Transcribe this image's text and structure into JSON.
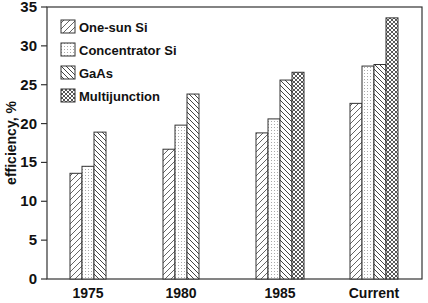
{
  "chart_data": {
    "type": "bar",
    "title": "",
    "xlabel": "",
    "ylabel": "efficiency, %",
    "ylim": [
      0,
      35
    ],
    "yticks": [
      0,
      5,
      10,
      15,
      20,
      25,
      30,
      35
    ],
    "grid": false,
    "legend_position": "upper-left",
    "categories": [
      "1975",
      "1980",
      "1985",
      "Current"
    ],
    "series": [
      {
        "name": "One-sun Si",
        "pattern": "diagonal-forward",
        "values": [
          13.6,
          16.7,
          18.8,
          22.6
        ]
      },
      {
        "name": "Concentrator Si",
        "pattern": "dots",
        "values": [
          14.5,
          19.8,
          20.6,
          27.4
        ]
      },
      {
        "name": "GaAs",
        "pattern": "diagonal-backward",
        "values": [
          18.9,
          23.8,
          25.6,
          27.6
        ]
      },
      {
        "name": "Multijunction",
        "pattern": "crosshatch",
        "values": [
          null,
          null,
          26.6,
          33.6
        ]
      }
    ]
  },
  "colors": {
    "ink": "#333333",
    "background": "#ffffff"
  }
}
